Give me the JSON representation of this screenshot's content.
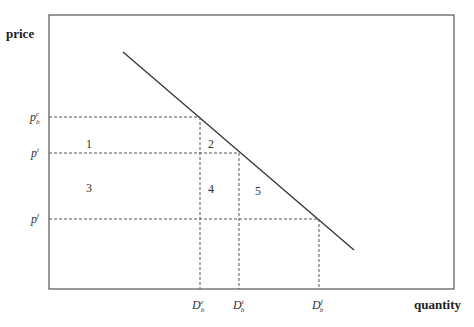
{
  "diagram": {
    "y_axis_label": "price",
    "x_axis_label": "quantity",
    "price_levels": [
      {
        "base": "p",
        "sup": "c",
        "sub": "b",
        "y": 117
      },
      {
        "base": "p",
        "sup": "t",
        "sub": "",
        "y": 153
      },
      {
        "base": "p",
        "sup": "f",
        "sub": "",
        "y": 219
      }
    ],
    "quantity_levels": [
      {
        "base": "D",
        "sup": "c",
        "sub": "b",
        "x": 200
      },
      {
        "base": "D",
        "sup": "t",
        "sub": "b",
        "x": 239
      },
      {
        "base": "D",
        "sup": "f",
        "sub": "b",
        "x": 319
      }
    ],
    "regions": [
      {
        "label": "1",
        "x": 89,
        "y": 147
      },
      {
        "label": "2",
        "x": 211,
        "y": 147
      },
      {
        "label": "3",
        "x": 89,
        "y": 190
      },
      {
        "label": "4",
        "x": 211,
        "y": 191
      },
      {
        "label": "5",
        "x": 258,
        "y": 193
      }
    ],
    "demand_line": {
      "x1": 123,
      "y1": 52,
      "x2": 354,
      "y2": 250
    }
  }
}
